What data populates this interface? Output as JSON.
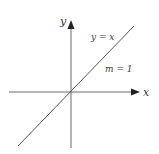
{
  "diagram": {
    "type": "coordinate-plane",
    "axes": {
      "x_label": "x",
      "y_label": "y"
    },
    "line": {
      "equation_label": "y = x",
      "slope_label": "m = 1"
    },
    "colors": {
      "axis": "#6a6a6a",
      "line": "#555555",
      "text": "#3a3a3a"
    }
  }
}
